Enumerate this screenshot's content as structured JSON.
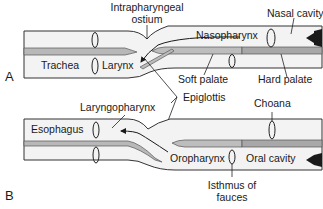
{
  "figure": {
    "panels": [
      {
        "id": "A",
        "label": "A",
        "labels": {
          "intrapharyngeal_1": "Intrapharyngeal",
          "intrapharyngeal_2": "ostium",
          "nasal_cavity": "Nasal cavity",
          "nasopharynx": "Nasopharynx",
          "trachea": "Trachea",
          "larynx": "Larynx",
          "soft_palate": "Soft palate",
          "hard_palate": "Hard palate"
        }
      },
      {
        "id": "B",
        "label": "B",
        "labels": {
          "laryngopharynx": "Laryngopharynx",
          "choana": "Choana",
          "esophagus": "Esophagus",
          "oropharynx": "Oropharynx",
          "oral_cavity": "Oral cavity",
          "isthmus_1": "Isthmus of",
          "isthmus_2": "fauces"
        }
      }
    ],
    "shared_labels": {
      "epiglottis": "Epiglottis"
    },
    "colors": {
      "tube_fill": "#f2f2f2",
      "outline": "#333333",
      "palate_fill": "#b5b5b5",
      "arrow": "#1a1a1a"
    }
  }
}
